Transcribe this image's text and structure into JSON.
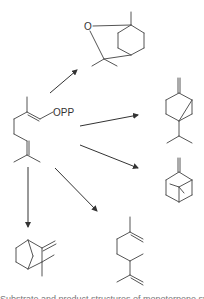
{
  "diagram": {
    "substrate": {
      "name": "geranyl diphosphate",
      "label": "OPP"
    },
    "products": [
      {
        "name": "1,8-cineole",
        "atom_label": "O"
      },
      {
        "name": "sabinene"
      },
      {
        "name": "alpha-pinene"
      },
      {
        "name": "camphene"
      },
      {
        "name": "myrcene"
      }
    ],
    "arrow_count": 5,
    "colors": {
      "bond": "#555555",
      "arrow": "#333333",
      "background": "#ffffff"
    }
  },
  "caption": {
    "text": "Substrate and product structures of monoterpene synthases"
  }
}
